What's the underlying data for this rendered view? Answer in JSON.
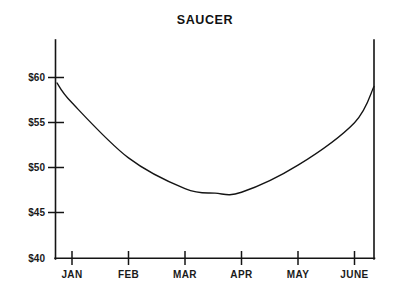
{
  "chart_data": {
    "type": "line",
    "title": "SAUCER",
    "xlabel": "",
    "ylabel": "",
    "grid": false,
    "legend": false,
    "legend_position": "none",
    "axis_style": "open-frame",
    "line_color": "#141414",
    "background_color": "#ffffff",
    "categories": [
      "JAN",
      "FEB",
      "MAR",
      "APR",
      "MAY",
      "JUNE"
    ],
    "x_tick_labels": [
      "JAN",
      "FEB",
      "MAR",
      "APR",
      "MAY",
      "JUNE"
    ],
    "y_tick_labels": [
      "$60",
      "$55",
      "$50",
      "$45",
      "$40"
    ],
    "y_tick_values": [
      60,
      55,
      50,
      45,
      40
    ],
    "ylim": [
      40,
      60
    ],
    "xlim": [
      "start",
      "end"
    ],
    "series": [
      {
        "name": "Price",
        "values": [
          57.2,
          51.1,
          47.7,
          47.3,
          50.3,
          59.0
        ],
        "points": [
          {
            "x": "start",
            "y": 59.4
          },
          {
            "x": "JAN",
            "y": 57.2
          },
          {
            "x": "FEB",
            "y": 51.1
          },
          {
            "x": "MAR",
            "y": 47.7
          },
          {
            "x": "mid-MAR-APR",
            "y": 47.2
          },
          {
            "x": "APR",
            "y": 47.3
          },
          {
            "x": "MAY",
            "y": 50.3
          },
          {
            "x": "JUNE",
            "y": 55.0
          },
          {
            "x": "end",
            "y": 59.0
          }
        ],
        "minimum": {
          "x": "mid-MAR-APR",
          "y": 47.2
        },
        "start_value": 59.4,
        "end_value": 59.0
      }
    ],
    "annotations": []
  },
  "layout": {
    "title_position": "top-center"
  }
}
